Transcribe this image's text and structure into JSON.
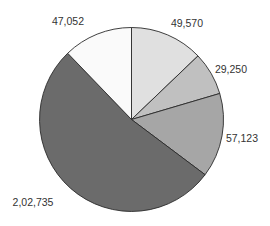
{
  "chart_data": {
    "type": "pie",
    "title": "",
    "start_angle_deg": 0,
    "direction": "clockwise",
    "legend": "none",
    "slices": [
      {
        "label": "49,570",
        "value": 49570,
        "color": "#e0e0e0",
        "label_pos": [
          187,
          24
        ]
      },
      {
        "label": "29,250",
        "value": 29250,
        "color": "#c0c0c0",
        "label_pos": [
          231,
          70
        ]
      },
      {
        "label": "57,123",
        "value": 57123,
        "color": "#a6a6a6",
        "label_pos": [
          242,
          139
        ]
      },
      {
        "label": "2,02,735",
        "value": 202735,
        "color": "#6b6b6b",
        "label_pos": [
          33,
          203
        ]
      },
      {
        "label": "47,052",
        "value": 47052,
        "color": "#fafafa",
        "label_pos": [
          68,
          22
        ]
      }
    ],
    "categories": [
      "49,570",
      "29,250",
      "57,123",
      "2,02,735",
      "47,052"
    ],
    "values": [
      49570,
      29250,
      57123,
      202735,
      47052
    ],
    "center": [
      131.5,
      119.5
    ],
    "radius": 92
  }
}
